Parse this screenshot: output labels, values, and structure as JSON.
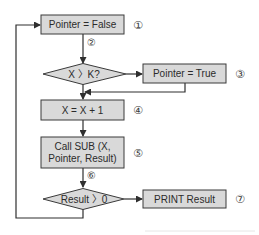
{
  "diagram": {
    "type": "flowchart",
    "colors": {
      "node_fill": "#d9d9d9",
      "node_stroke": "#3a3a3a",
      "connector": "#2f2f2f",
      "background": "#ffffff"
    },
    "nodes": [
      {
        "id": "1",
        "shape": "process",
        "label": "Pointer = False",
        "step": "①"
      },
      {
        "id": "2",
        "shape": "decision",
        "label": "X 〉K?",
        "step": "②"
      },
      {
        "id": "3",
        "shape": "process",
        "label": "Pointer = True",
        "step": "③"
      },
      {
        "id": "4",
        "shape": "process",
        "label": "X = X + 1",
        "step": "④"
      },
      {
        "id": "5",
        "shape": "process",
        "label_line1": "Call SUB (X,",
        "label_line2": "Pointer, Result)",
        "step": "⑤"
      },
      {
        "id": "6",
        "shape": "decision",
        "label": "Result 〉0",
        "step": "⑥"
      },
      {
        "id": "7",
        "shape": "process",
        "label": "PRINT Result",
        "step": "⑦"
      }
    ],
    "edges": [
      {
        "from": "1",
        "to": "2"
      },
      {
        "from": "2",
        "to": "3",
        "direction": "right (yes)"
      },
      {
        "from": "2",
        "to": "4",
        "direction": "down (no)"
      },
      {
        "from": "3",
        "to": "4",
        "direction": "merge back"
      },
      {
        "from": "4",
        "to": "5"
      },
      {
        "from": "5",
        "to": "6"
      },
      {
        "from": "6",
        "to": "7",
        "direction": "right (yes)"
      },
      {
        "from": "6",
        "to": "1",
        "direction": "loop back (no)"
      }
    ]
  }
}
